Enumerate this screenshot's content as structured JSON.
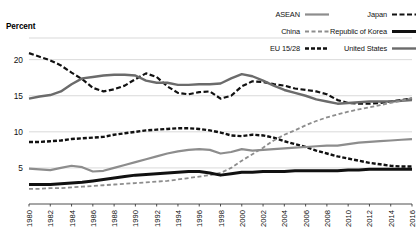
{
  "axis_title": "Percent",
  "legend": {
    "items": [
      {
        "label": "ASEAN",
        "color": "#8d8d8d",
        "style": "solid",
        "width": 2.2,
        "dash": ""
      },
      {
        "label": "Japan",
        "color": "#111111",
        "style": "dashed",
        "width": 2.2,
        "dash": "5,2.5"
      },
      {
        "label": "China",
        "color": "#8d8d8d",
        "style": "dashed",
        "width": 1.8,
        "dash": "4,2.5"
      },
      {
        "label": "Republic of Korea",
        "color": "#111111",
        "style": "solid",
        "width": 3.0,
        "dash": ""
      },
      {
        "label": "EU 15/28",
        "color": "#111111",
        "style": "dashed",
        "width": 2.4,
        "dash": "4,2"
      },
      {
        "label": "United States",
        "color": "#6b6b6b",
        "style": "solid",
        "width": 2.4,
        "dash": ""
      }
    ]
  },
  "chart_data": {
    "type": "line",
    "title": "",
    "xlabel": "",
    "ylabel": "Percent",
    "ylim": [
      0,
      23
    ],
    "xlim": [
      1980,
      2016
    ],
    "grid": true,
    "legend_position": "top-right",
    "yticks": [
      5,
      10,
      15,
      20
    ],
    "ytick_labels": [
      "5",
      "10",
      "15",
      "20"
    ],
    "x": [
      1980,
      1981,
      1982,
      1983,
      1984,
      1985,
      1986,
      1987,
      1988,
      1989,
      1990,
      1991,
      1992,
      1993,
      1994,
      1995,
      1996,
      1997,
      1998,
      1999,
      2000,
      2001,
      2002,
      2003,
      2004,
      2005,
      2006,
      2007,
      2008,
      2009,
      2010,
      2011,
      2012,
      2013,
      2014,
      2015,
      2016
    ],
    "xtick_labels": [
      "1980",
      "1982",
      "1984",
      "1986",
      "1988",
      "1990",
      "1992",
      "1994",
      "1996",
      "1998",
      "2000",
      "2002",
      "2004",
      "2006",
      "2008",
      "2010",
      "2012",
      "2014",
      "2016"
    ],
    "series": [
      {
        "name": "Japan",
        "color": "#111111",
        "dash": "5,2.5",
        "width": 2.2,
        "values": [
          20.9,
          20.4,
          19.9,
          19.2,
          18.2,
          17.3,
          16.1,
          15.6,
          15.9,
          16.4,
          17.3,
          18.1,
          17.6,
          16.3,
          15.4,
          15.2,
          15.5,
          15.6,
          14.6,
          15.0,
          16.3,
          17.0,
          16.9,
          16.6,
          16.4,
          16.0,
          15.8,
          15.6,
          15.2,
          14.4,
          14.0,
          13.9,
          13.9,
          14.0,
          14.2,
          14.4,
          14.6
        ]
      },
      {
        "name": "United States",
        "color": "#6b6b6b",
        "dash": "",
        "width": 2.4,
        "values": [
          14.6,
          14.9,
          15.1,
          15.6,
          16.6,
          17.4,
          17.6,
          17.8,
          17.9,
          17.9,
          17.8,
          17.1,
          16.8,
          16.8,
          16.5,
          16.5,
          16.6,
          16.6,
          16.7,
          17.4,
          18.0,
          17.7,
          17.1,
          16.4,
          15.8,
          15.4,
          15.0,
          14.5,
          14.2,
          13.9,
          14.0,
          14.1,
          14.2,
          14.2,
          14.2,
          14.3,
          14.4
        ]
      },
      {
        "name": "EU 15/28",
        "color": "#111111",
        "dash": "4,2",
        "width": 2.4,
        "values": [
          8.6,
          8.6,
          8.7,
          8.8,
          9.0,
          9.1,
          9.2,
          9.3,
          9.6,
          9.8,
          10.0,
          10.2,
          10.3,
          10.4,
          10.5,
          10.5,
          10.4,
          10.2,
          9.9,
          9.5,
          9.4,
          9.6,
          9.5,
          9.2,
          8.7,
          8.3,
          7.9,
          7.4,
          7.0,
          6.6,
          6.3,
          6.0,
          5.7,
          5.5,
          5.3,
          5.2,
          5.2
        ]
      },
      {
        "name": "ASEAN",
        "color": "#8d8d8d",
        "dash": "",
        "width": 2.2,
        "values": [
          4.9,
          4.8,
          4.7,
          5.0,
          5.3,
          5.1,
          4.5,
          4.6,
          5.0,
          5.4,
          5.8,
          6.2,
          6.6,
          7.0,
          7.3,
          7.5,
          7.6,
          7.5,
          7.0,
          7.2,
          7.6,
          7.4,
          7.5,
          7.6,
          7.7,
          7.8,
          7.9,
          8.0,
          8.1,
          8.1,
          8.3,
          8.5,
          8.6,
          8.7,
          8.8,
          8.9,
          9.0
        ]
      },
      {
        "name": "China",
        "color": "#8d8d8d",
        "dash": "4,2.5",
        "width": 1.8,
        "values": [
          2.1,
          2.1,
          2.2,
          2.2,
          2.3,
          2.4,
          2.5,
          2.6,
          2.7,
          2.8,
          2.9,
          3.0,
          3.1,
          3.2,
          3.4,
          3.6,
          3.8,
          4.0,
          4.3,
          5.0,
          6.0,
          6.9,
          7.8,
          8.8,
          9.6,
          10.2,
          10.9,
          11.5,
          12.0,
          12.4,
          12.8,
          13.1,
          13.4,
          13.7,
          14.0,
          14.3,
          14.7
        ]
      },
      {
        "name": "Republic of Korea",
        "color": "#111111",
        "dash": "",
        "width": 3.0,
        "values": [
          2.7,
          2.7,
          2.7,
          2.8,
          2.9,
          3.0,
          3.2,
          3.4,
          3.6,
          3.8,
          4.0,
          4.1,
          4.2,
          4.3,
          4.4,
          4.5,
          4.5,
          4.3,
          4.0,
          4.2,
          4.4,
          4.4,
          4.5,
          4.5,
          4.5,
          4.6,
          4.6,
          4.6,
          4.6,
          4.6,
          4.7,
          4.7,
          4.8,
          4.8,
          4.8,
          4.8,
          4.8
        ]
      }
    ]
  }
}
